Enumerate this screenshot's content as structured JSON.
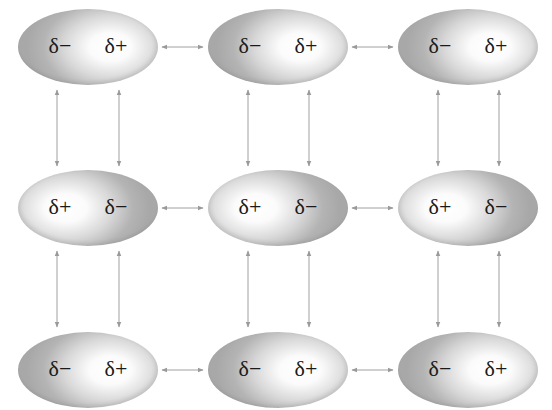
{
  "diagram": {
    "type": "dipole-dipole interactions lattice",
    "colors": {
      "arrow": "#9a9a9a",
      "shade_dark": "#a8a8a8",
      "shade_light": "#ffffff",
      "text": "#1a1a1a"
    },
    "rows": [
      {
        "molecules": [
          {
            "left": "δ−",
            "right": "δ+"
          },
          {
            "left": "δ−",
            "right": "δ+"
          },
          {
            "left": "δ−",
            "right": "δ+"
          }
        ]
      },
      {
        "molecules": [
          {
            "left": "δ+",
            "right": "δ−"
          },
          {
            "left": "δ+",
            "right": "δ−"
          },
          {
            "left": "δ+",
            "right": "δ−"
          }
        ]
      },
      {
        "molecules": [
          {
            "left": "δ−",
            "right": "δ+"
          },
          {
            "left": "δ−",
            "right": "δ+"
          },
          {
            "left": "δ−",
            "right": "δ+"
          }
        ]
      }
    ]
  }
}
